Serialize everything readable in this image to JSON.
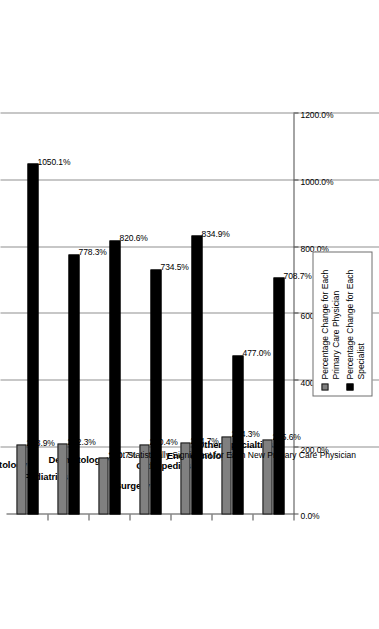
{
  "chart_data": {
    "type": "bar",
    "title": "",
    "xlabel": "",
    "ylabel": "",
    "ylim": [
      0,
      1200
    ],
    "grid": true,
    "orientation": "vertical-rotated",
    "legend_position": "top-right",
    "categories": [
      "Neonatology",
      "Pediatrics",
      "Dermatology*",
      "Surgery",
      "Orthopedics",
      "Endocrinology",
      "Other Specialties"
    ],
    "tick_labels": [
      "0.0%",
      "200.0%",
      "400.0%",
      "600.0%",
      "800.0%",
      "1000.0%",
      "1200.0%"
    ],
    "ticks": [
      0,
      200,
      400,
      600,
      800,
      1000,
      1200
    ],
    "series": [
      {
        "name": "Percentage Change for Each\nPrimary Care Physician",
        "color": "#808080",
        "values": [
          208.9,
          212.3,
          170.7,
          210.4,
          214.7,
          234.3,
          225.6
        ],
        "labels": [
          "208.9%",
          "212.3%",
          "170.7%",
          "210.4%",
          "214.7%",
          "234.3%",
          "225.6%"
        ]
      },
      {
        "name": "Percentage Change for Each\nSpecialist",
        "color": "#000000",
        "values": [
          1050.1,
          778.3,
          820.6,
          734.5,
          834.9,
          477.0,
          708.7
        ],
        "labels": [
          "1050.1%",
          "778.3%",
          "820.6%",
          "734.5%",
          "834.9%",
          "477.0%",
          "708.7%"
        ]
      }
    ],
    "annotations": [
      {
        "text": "*Not Statistically Significant for Each New Primary Care Physician",
        "category": "Dermatology*"
      }
    ]
  },
  "legend": {
    "entries": [
      {
        "label": "Percentage Change for Each\nPrimary Care Physician",
        "swatch": "primary-care-swatch"
      },
      {
        "label": "Percentage Change for Each\nSpecialist",
        "swatch": "specialist-swatch"
      }
    ]
  }
}
